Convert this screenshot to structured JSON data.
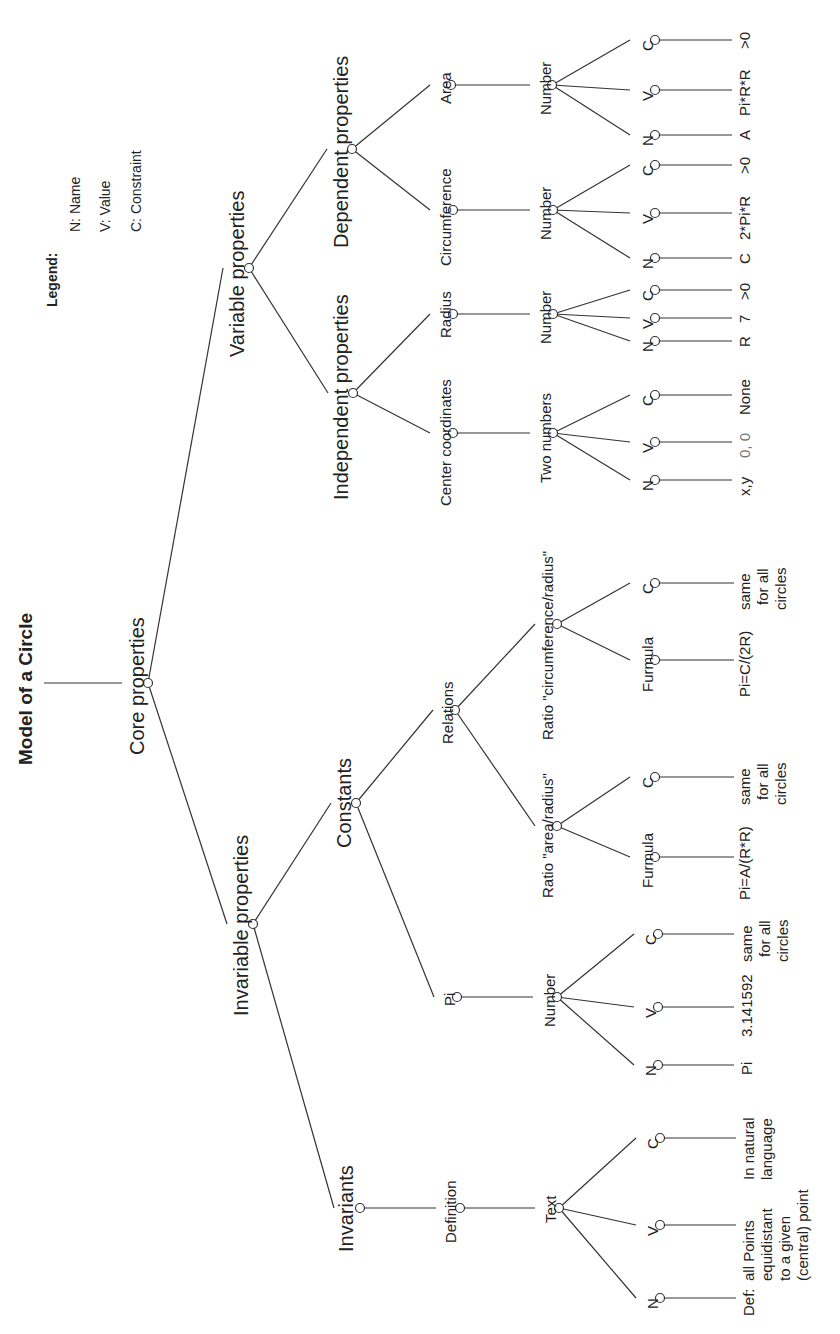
{
  "title": "Model of a Circle",
  "legend": {
    "heading": "Legend:",
    "items": [
      "N: Name",
      "V: Value",
      "C: Constraint"
    ]
  },
  "labels": {
    "core": "Core properties",
    "variable": "Variable properties",
    "invariable": "Invariable properties",
    "independent": "Independent properties",
    "dependent": "Dependent properties",
    "constants": "Constants",
    "invariants": "Invariants",
    "center": "Center coordinates",
    "radius": "Radius",
    "circumference": "Circumference",
    "area": "Area",
    "relations": "Relations",
    "pi": "Pi",
    "definition": "Definition",
    "center_type": "Two numbers",
    "radius_type": "Number",
    "circ_type": "Number",
    "area_type": "Number",
    "ratio_circ": "Ratio \"circumference/radius\"",
    "ratio_area": "Ratio \"area/radius\"",
    "pi_type": "Number",
    "def_type": "Text",
    "formula": "Furmula",
    "n": "N",
    "v": "V",
    "c": "C"
  },
  "leaves": {
    "center_n": "x,y",
    "center_v": "0, 0",
    "center_c": "None",
    "radius_n": "R",
    "radius_v": "7",
    "radius_c": ">0",
    "circ_n": "C",
    "circ_v": "2*Pi*R",
    "circ_c": ">0",
    "area_n": "A",
    "area_v": "Pi*R*R",
    "area_c": ">0",
    "ratio_circ_formula": "Pi=C/(2R)",
    "ratio_circ_c": [
      "same",
      "for all",
      "circles"
    ],
    "ratio_area_formula": "Pi=A/(R*R)",
    "ratio_area_c": [
      "same",
      "for all",
      "circles"
    ],
    "pi_n": "Pi",
    "pi_v": "3.141592",
    "pi_c": [
      "same",
      "for all",
      "circles"
    ],
    "def_n": "Def:",
    "def_v": [
      "all Points",
      "equidistant",
      "to a given",
      "(central) point"
    ],
    "def_c": [
      "In natural",
      "language"
    ]
  }
}
